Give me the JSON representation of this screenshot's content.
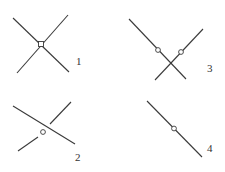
{
  "diagram": {
    "figures": [
      {
        "label": "1",
        "type": "two lines crossing at a point with square marker at intersection"
      },
      {
        "label": "2",
        "type": "two lines, one continuous with circle marker, the other broken at crossing"
      },
      {
        "label": "3",
        "type": "two lines crossing, each with a circle marker above intersection"
      },
      {
        "label": "4",
        "type": "single line with circle marker"
      }
    ],
    "colors": {
      "stroke": "#3a3a3a",
      "background": "#ffffff"
    }
  }
}
